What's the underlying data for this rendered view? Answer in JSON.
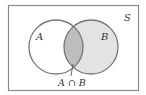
{
  "diagram": {
    "type": "venn",
    "universe_label": "S",
    "sets": [
      {
        "label": "A",
        "fill": "#ffffff"
      },
      {
        "label": "B",
        "fill": "#e3e3e3"
      }
    ],
    "intersection": {
      "label": "A ∩ B",
      "fill": "#bdbdbd"
    },
    "colors": {
      "stroke": "#777777",
      "border": "#8a8a8a",
      "text": "#333333"
    }
  }
}
